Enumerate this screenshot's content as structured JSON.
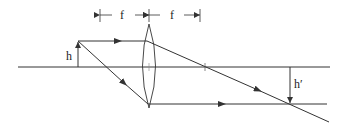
{
  "diagram": {
    "type": "optics-ray-diagram",
    "labels": {
      "focal_left": "f",
      "focal_right": "f",
      "object_height": "h",
      "image_height": "h′"
    },
    "colors": {
      "line": "#333333",
      "background": "#ffffff"
    },
    "geometry": {
      "optical_axis": {
        "y": 67,
        "x1": 18,
        "x2": 330
      },
      "lens": {
        "x": 149,
        "top": 24,
        "bottom": 108
      },
      "focal_markers_x": [
        100,
        149,
        200
      ],
      "object": {
        "x": 78,
        "base_y": 67,
        "tip_y": 41
      },
      "image": {
        "x": 290,
        "base_y": 67,
        "tip_y": 104
      },
      "focal_point_right_x": 205
    }
  }
}
